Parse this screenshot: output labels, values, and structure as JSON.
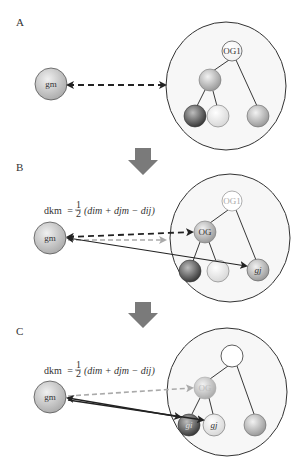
{
  "panels": [
    {
      "label": "A",
      "left_node": "gm",
      "root_label": "OG1",
      "leaf_labels": [
        "",
        "",
        ""
      ]
    },
    {
      "label": "B",
      "left_node": "gm",
      "formula": {
        "lhs": "dkm",
        "eq": "=",
        "frac_num": "1",
        "frac_den": "2",
        "rhs": "(dim + djm − dij)"
      },
      "root_label": "OG1",
      "mid_label": "OG",
      "leaf_labels": [
        "",
        "",
        "gj"
      ]
    },
    {
      "label": "C",
      "left_node": "gm",
      "formula": {
        "lhs": "dkm",
        "eq": "=",
        "frac_num": "1",
        "frac_den": "2",
        "rhs": "(dim + djm − dij)"
      },
      "mid_label": "OG",
      "leaf_labels": [
        "gi",
        "gj",
        ""
      ]
    }
  ],
  "colors": {
    "node_light": "#e8e8e8",
    "node_mid": "#b8b8b8",
    "node_dark": "#555555",
    "arrow_block": "#7a7a7a",
    "line": "#222222",
    "dashed_faint": "#aaaaaa"
  }
}
